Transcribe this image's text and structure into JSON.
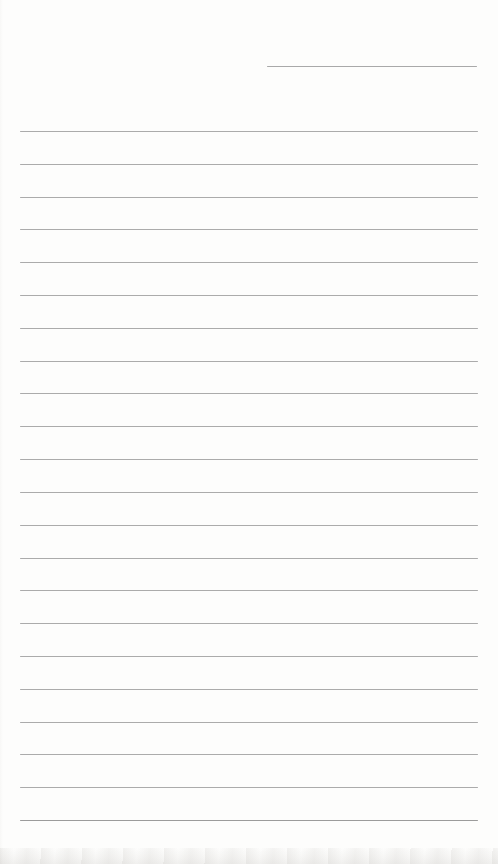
{
  "page": {
    "kind": "blank-ruled-notebook-page",
    "background_color": "#fdfdfc",
    "edge_shadow_color": "#8c8780"
  },
  "header_line": {
    "y": 66,
    "x_start": 267,
    "x_end": 477,
    "color": "#a9a9a9"
  },
  "ruling": {
    "line_count": 22,
    "first_line_y": 131,
    "line_spacing": 32.81,
    "x_start": 20,
    "x_end": 478,
    "line_color": "#ababab",
    "last_line_color": "#9b9b9b"
  }
}
